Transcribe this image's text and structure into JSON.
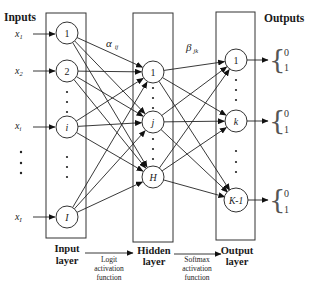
{
  "headers": {
    "inputs": "Inputs",
    "outputs": "Outputs"
  },
  "inputs": {
    "x_labels": [
      {
        "base": "x",
        "sub": "1"
      },
      {
        "base": "x",
        "sub": "2"
      },
      {
        "base": "x",
        "sub": "i"
      },
      {
        "base": "x",
        "sub": "I"
      }
    ]
  },
  "layers": {
    "input": {
      "name_line1": "Input",
      "name_line2": "layer",
      "nodes": [
        "1",
        "2",
        "i",
        "I"
      ]
    },
    "hidden": {
      "name_line1": "Hidden",
      "name_line2": "layer",
      "nodes": [
        "1",
        "j",
        "H"
      ]
    },
    "output": {
      "name_line1": "Output",
      "name_line2": "layer",
      "nodes": [
        "1",
        "k",
        "K-1"
      ]
    }
  },
  "weights": {
    "alpha": {
      "symbol": "α",
      "sub": "ij"
    },
    "beta": {
      "symbol": "β",
      "sub": "jk"
    }
  },
  "activations": {
    "logit": {
      "line1": "Logit",
      "line2": "activation",
      "line3": "function"
    },
    "softmax": {
      "line1": "Softmax",
      "line2": "activation",
      "line3": "function"
    }
  },
  "outputs": {
    "values": [
      {
        "top": "0",
        "bottom": "1"
      },
      {
        "top": "0",
        "bottom": "1"
      },
      {
        "top": "0",
        "bottom": "1"
      }
    ]
  }
}
